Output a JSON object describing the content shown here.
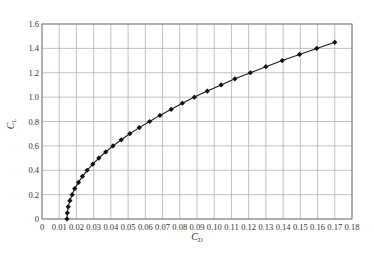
{
  "top_fragment": "",
  "caption": "",
  "chart_data": {
    "type": "line",
    "title": "",
    "xlabel": "C_D",
    "ylabel": "C_L",
    "xlim": [
      0,
      0.18
    ],
    "ylim": [
      0,
      1.6
    ],
    "x_ticks": [
      "0",
      "0.01",
      "0.02",
      "0.03",
      "0.04",
      "0.05",
      "0.06",
      "0.07",
      "0.08",
      "0.09",
      "0.10",
      "0.11",
      "0.12",
      "0.13",
      "0.14",
      "0.15",
      "0.16",
      "0.17",
      "0.18"
    ],
    "y_ticks": [
      "0",
      "0.2",
      "0.4",
      "0.6",
      "0.8",
      "1.0",
      "1.2",
      "1.4",
      "1.6"
    ],
    "grid": true,
    "legend": null,
    "marker": "diamond",
    "series": [
      {
        "name": "drag polar",
        "x": [
          0.0145,
          0.0147,
          0.0152,
          0.0162,
          0.0175,
          0.019,
          0.0212,
          0.0235,
          0.0262,
          0.0295,
          0.033,
          0.037,
          0.0412,
          0.046,
          0.051,
          0.0565,
          0.0625,
          0.0685,
          0.075,
          0.0815,
          0.0885,
          0.096,
          0.104,
          0.112,
          0.121,
          0.13,
          0.1395,
          0.1495,
          0.1595,
          0.17
        ],
        "y": [
          0.0,
          0.05,
          0.1,
          0.15,
          0.2,
          0.25,
          0.3,
          0.35,
          0.4,
          0.45,
          0.5,
          0.55,
          0.6,
          0.65,
          0.7,
          0.75,
          0.8,
          0.85,
          0.9,
          0.95,
          1.0,
          1.05,
          1.1,
          1.15,
          1.2,
          1.25,
          1.3,
          1.35,
          1.4,
          1.45
        ]
      }
    ]
  }
}
